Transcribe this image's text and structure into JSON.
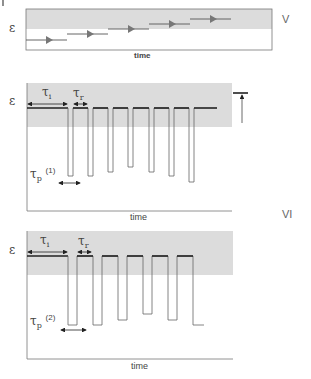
{
  "corner_mark": "|",
  "panels": {
    "V": {
      "roman_label": "V",
      "y_label": "ε",
      "x_label": "time",
      "steps": 5
    },
    "VI_top": {
      "y_label": "ε",
      "x_label": "time",
      "tau_i": "τ",
      "tau_i_sub": "i",
      "tau_r": "τ",
      "tau_r_sub": "r",
      "tau_p": "τ",
      "tau_p_sub": "p",
      "tau_p_sup": "(1)",
      "pulse_count": 6
    },
    "VI_roman": "VI",
    "VI_bottom": {
      "y_label": "ε",
      "x_label": "time",
      "tau_i": "τ",
      "tau_i_sub": "i",
      "tau_r": "τ",
      "tau_r_sub": "r",
      "tau_p": "τ",
      "tau_p_sub": "p",
      "tau_p_sup": "(2)",
      "pulse_count": 5
    }
  },
  "colors": {
    "gray_band": "#dcdcdc",
    "line": "#555555",
    "baseline": "#222222",
    "arrow_fill": "#777777"
  }
}
